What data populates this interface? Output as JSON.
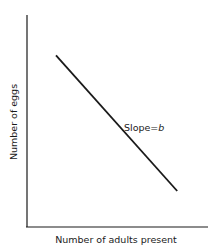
{
  "chart_data": {
    "type": "line",
    "title": "",
    "xlabel": "Number of adults present",
    "ylabel": "Number of eggs",
    "xlim": [
      0,
      1
    ],
    "ylim": [
      0,
      1
    ],
    "grid": false,
    "legend": "none",
    "series": [
      {
        "name": "eggs vs adults",
        "x": [
          0.16,
          0.83
        ],
        "y": [
          0.81,
          0.17
        ]
      }
    ],
    "annotations": [
      {
        "text": "Slope = b",
        "anchor": "on-line-right",
        "x": 0.52,
        "y": 0.5
      }
    ],
    "colors": {
      "ink": "#1a1a1a",
      "background": "#ffffff"
    }
  }
}
